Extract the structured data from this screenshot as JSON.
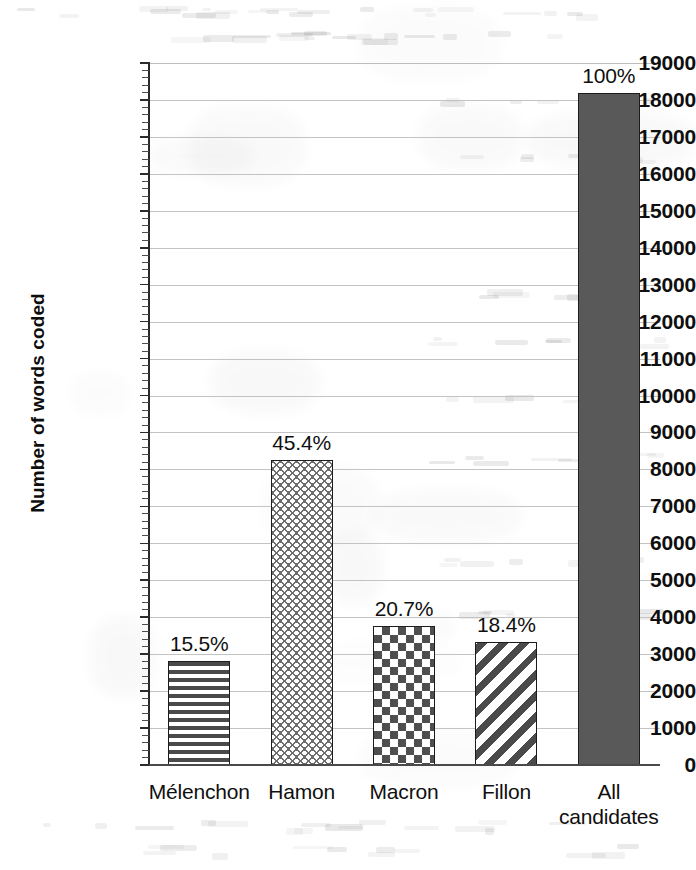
{
  "chart_data": {
    "type": "bar",
    "title": "",
    "subtitle": "",
    "xlabel": "",
    "ylabel": "Number of words coded",
    "ylim": [
      0,
      19000
    ],
    "ytick_step": 1000,
    "grid": true,
    "legend": "none",
    "categories": [
      "Mélenchon",
      "Hamon",
      "Macron",
      "Fillon",
      "All candidates"
    ],
    "values": [
      2820,
      8250,
      3760,
      3340,
      18200
    ],
    "data_labels": [
      "15.5%",
      "45.4%",
      "20.7%",
      "18.4%",
      "100%"
    ],
    "bar_patterns": [
      "horizontal-stripes",
      "zigzag-wave",
      "checkerboard",
      "diagonal-stripes",
      "solid-gray"
    ],
    "ytick_labels": [
      "19000",
      "18000",
      "17000",
      "16000",
      "15000",
      "14000",
      "13000",
      "12000",
      "11000",
      "10000",
      "9000",
      "8000",
      "7000",
      "6000",
      "5000",
      "4000",
      "3000",
      "2000",
      "1000",
      "0"
    ],
    "ytick_values": [
      19000,
      18000,
      17000,
      16000,
      15000,
      14000,
      13000,
      12000,
      11000,
      10000,
      9000,
      8000,
      7000,
      6000,
      5000,
      4000,
      3000,
      2000,
      1000,
      0
    ],
    "colors": {
      "solid_bar": "#595959",
      "bar_outline": "#1c1c1c",
      "gridline": "#c3c3c3",
      "axis": "#2a2a2a",
      "text": "#0f0f0f",
      "background": "#ffffff"
    }
  },
  "xtick_labels_wrapped": [
    [
      "Mélenchon"
    ],
    [
      "Hamon"
    ],
    [
      "Macron"
    ],
    [
      "Fillon"
    ],
    [
      "All",
      "candidates"
    ]
  ]
}
